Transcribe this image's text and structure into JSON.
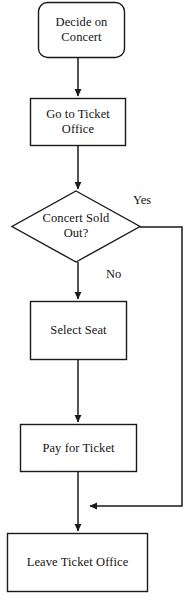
{
  "diagram": {
    "type": "flowchart",
    "background_color": "#fefefe",
    "stroke_color": "#1a1a1a",
    "text_color": "#141414",
    "nodes": [
      {
        "id": "decide",
        "shape": "rounded-rectangle",
        "label": "Decide on\nConcert"
      },
      {
        "id": "go-to-ticket-office",
        "shape": "rectangle",
        "label": "Go to Ticket\nOffice"
      },
      {
        "id": "concert-sold-out",
        "shape": "diamond",
        "label": "Concert Sold\nOut?"
      },
      {
        "id": "select-seat",
        "shape": "rectangle",
        "label": "Select Seat"
      },
      {
        "id": "pay-for-ticket",
        "shape": "rectangle",
        "label": "Pay for Ticket"
      },
      {
        "id": "leave-ticket-office",
        "shape": "rectangle",
        "label": "Leave Ticket Office"
      }
    ],
    "edges": [
      {
        "id": "decide-to-office",
        "from": "decide",
        "to": "go-to-ticket-office",
        "label": ""
      },
      {
        "id": "office-to-decision",
        "from": "go-to-ticket-office",
        "to": "concert-sold-out",
        "label": ""
      },
      {
        "id": "decision-yes",
        "from": "concert-sold-out",
        "to": "leave-ticket-office",
        "label": "Yes"
      },
      {
        "id": "decision-no",
        "from": "concert-sold-out",
        "to": "select-seat",
        "label": "No"
      },
      {
        "id": "seat-to-pay",
        "from": "select-seat",
        "to": "pay-for-ticket",
        "label": ""
      },
      {
        "id": "pay-to-leave",
        "from": "pay-for-ticket",
        "to": "leave-ticket-office",
        "label": ""
      }
    ]
  }
}
